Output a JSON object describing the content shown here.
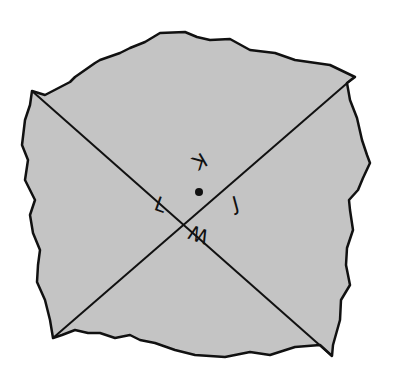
{
  "diagram": {
    "colors": {
      "plane_fill": "#c4c4c4",
      "stroke": "#111111",
      "background": "#ffffff"
    },
    "intersection_point": {
      "x": 199,
      "y": 192
    },
    "lines": [
      {
        "name": "line-top-left-to-bottom-right",
        "x1": 32,
        "y1": 91,
        "x2": 332,
        "y2": 356
      },
      {
        "name": "line-top-right-to-bottom-left",
        "x1": 353,
        "y1": 78,
        "x2": 53,
        "y2": 338
      }
    ],
    "angle_labels": [
      {
        "text": "K",
        "position": "top",
        "x": 199,
        "y": 160,
        "rotate": 150
      },
      {
        "text": "J",
        "position": "right",
        "x": 233,
        "y": 207,
        "rotate": -20
      },
      {
        "text": "W",
        "position": "bottom",
        "x": 200,
        "y": 235,
        "rotate": 200
      },
      {
        "text": "L",
        "position": "left",
        "x": 160,
        "y": 208,
        "rotate": 20
      }
    ]
  }
}
